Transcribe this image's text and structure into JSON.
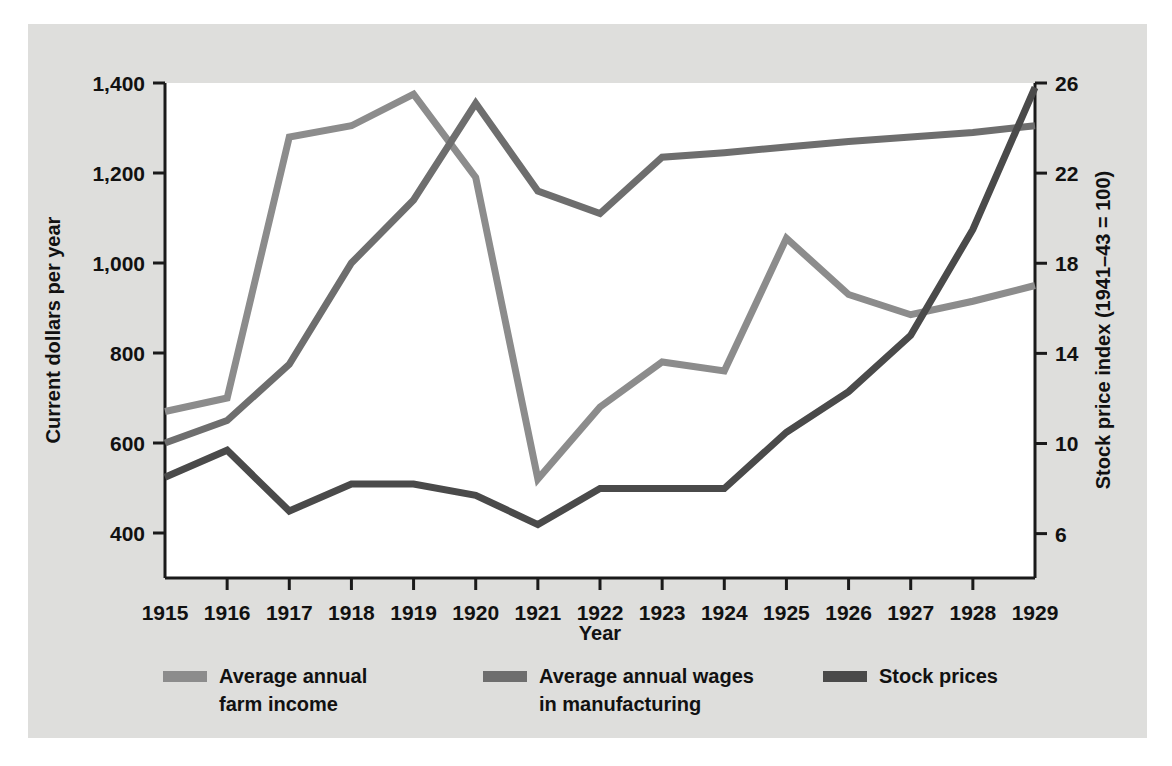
{
  "figure": {
    "background_color": "#dededc",
    "plot_background_color": "#ffffff",
    "axis_color": "#1a1a1a"
  },
  "chart_data": {
    "type": "line",
    "title": "",
    "xlabel": "Year",
    "ylabel": "Current dollars per year",
    "y2label": "Stock price index (1941–43 = 100)",
    "grid": false,
    "legend_position": "bottom",
    "x": [
      1915,
      1916,
      1917,
      1918,
      1919,
      1920,
      1921,
      1922,
      1923,
      1924,
      1925,
      1926,
      1927,
      1928,
      1929
    ],
    "xticklabels": [
      "1915",
      "1916",
      "1917",
      "1918",
      "1919",
      "1920",
      "1921",
      "1922",
      "1923",
      "1924",
      "1925",
      "1926",
      "1927",
      "1928",
      "1929"
    ],
    "xlim": [
      1915,
      1929
    ],
    "ylim": [
      300,
      1400
    ],
    "yticks": [
      400,
      600,
      800,
      1000,
      1200,
      1400
    ],
    "yticklabels": [
      "400",
      "600",
      "800",
      "1,000",
      "1,200",
      "1,400"
    ],
    "y2lim": [
      4.03,
      26
    ],
    "y2ticks": [
      6,
      10,
      14,
      18,
      22,
      26
    ],
    "y2ticklabels": [
      "6",
      "10",
      "14",
      "18",
      "22",
      "26"
    ],
    "series": [
      {
        "name": "Average annual farm income",
        "legend_label_line1": "Average annual",
        "legend_label_line2": "farm income",
        "color": "#8c8c8c",
        "axis": "left",
        "values": [
          670,
          700,
          1280,
          1305,
          1375,
          1190,
          520,
          680,
          780,
          760,
          1055,
          930,
          885,
          915,
          950
        ]
      },
      {
        "name": "Average annual wages in manufacturing",
        "legend_label_line1": "Average annual wages",
        "legend_label_line2": "in manufacturing",
        "color": "#6e6e6e",
        "axis": "left",
        "values": [
          600,
          650,
          775,
          1000,
          1140,
          1355,
          1160,
          1110,
          1235,
          1245,
          1258,
          1270,
          1280,
          1290,
          1305
        ]
      },
      {
        "name": "Stock prices",
        "legend_label_line1": "Stock prices",
        "legend_label_line2": "",
        "color": "#4a4a4a",
        "axis": "right",
        "values": [
          8.5,
          9.7,
          7.0,
          8.2,
          8.2,
          7.7,
          6.4,
          8.0,
          8.0,
          8.0,
          10.5,
          12.3,
          14.8,
          19.5,
          25.8
        ]
      }
    ]
  },
  "legend": {
    "items": [
      {
        "label_line1": "Average annual",
        "label_line2": "farm income",
        "color": "#8c8c8c"
      },
      {
        "label_line1": "Average annual wages",
        "label_line2": "in manufacturing",
        "color": "#6e6e6e"
      },
      {
        "label_line1": "Stock prices",
        "label_line2": "",
        "color": "#4a4a4a"
      }
    ]
  }
}
